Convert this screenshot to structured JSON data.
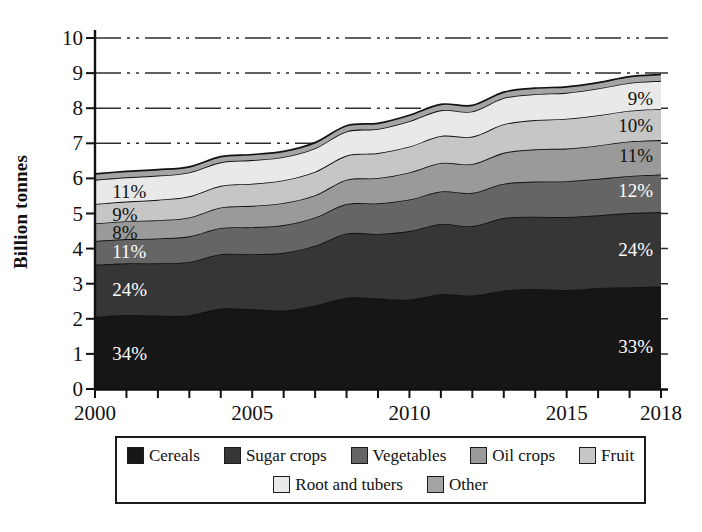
{
  "chart_data": {
    "type": "area",
    "stacked": true,
    "ylabel": "Billion tonnes",
    "ylim": [
      0,
      10
    ],
    "yticks": [
      0,
      1,
      2,
      3,
      4,
      5,
      6,
      7,
      8,
      9,
      10
    ],
    "x": [
      2000,
      2001,
      2002,
      2003,
      2004,
      2005,
      2006,
      2007,
      2008,
      2009,
      2010,
      2011,
      2012,
      2013,
      2014,
      2015,
      2016,
      2017,
      2018
    ],
    "xtick_labeled_years": [
      2000,
      2005,
      2010,
      2015,
      2018
    ],
    "grid": {
      "visible": true,
      "style": "dash-dot",
      "color": "#2e2e2e"
    },
    "legend_position": "bottom",
    "series": [
      {
        "name": "Cereals",
        "color": "#161616",
        "values": [
          2.06,
          2.11,
          2.09,
          2.1,
          2.29,
          2.27,
          2.24,
          2.38,
          2.6,
          2.58,
          2.55,
          2.7,
          2.66,
          2.81,
          2.85,
          2.82,
          2.88,
          2.9,
          2.92
        ]
      },
      {
        "name": "Sugar crops",
        "color": "#363636",
        "values": [
          1.48,
          1.47,
          1.49,
          1.52,
          1.55,
          1.57,
          1.64,
          1.7,
          1.83,
          1.84,
          1.95,
          2.0,
          1.98,
          2.06,
          2.06,
          2.08,
          2.07,
          2.11,
          2.12
        ]
      },
      {
        "name": "Vegetables",
        "color": "#656565",
        "values": [
          0.68,
          0.69,
          0.71,
          0.73,
          0.75,
          0.77,
          0.79,
          0.81,
          0.84,
          0.87,
          0.9,
          0.93,
          0.95,
          0.98,
          1.0,
          1.02,
          1.04,
          1.06,
          1.07
        ]
      },
      {
        "name": "Oil crops",
        "color": "#9a9a9a",
        "values": [
          0.5,
          0.51,
          0.52,
          0.54,
          0.58,
          0.61,
          0.63,
          0.63,
          0.69,
          0.72,
          0.77,
          0.81,
          0.82,
          0.88,
          0.92,
          0.93,
          0.95,
          0.98,
          0.98
        ]
      },
      {
        "name": "Fruit",
        "color": "#c6c6c6",
        "values": [
          0.55,
          0.56,
          0.58,
          0.6,
          0.62,
          0.63,
          0.65,
          0.67,
          0.69,
          0.71,
          0.74,
          0.77,
          0.78,
          0.81,
          0.83,
          0.85,
          0.86,
          0.88,
          0.89
        ]
      },
      {
        "name": "Root and tubers",
        "color": "#e9e9e9",
        "values": [
          0.69,
          0.69,
          0.69,
          0.68,
          0.67,
          0.67,
          0.66,
          0.67,
          0.69,
          0.69,
          0.72,
          0.73,
          0.72,
          0.75,
          0.74,
          0.74,
          0.76,
          0.79,
          0.8
        ]
      },
      {
        "name": "Other",
        "color": "#a4a4a4",
        "values": [
          0.17,
          0.17,
          0.17,
          0.16,
          0.16,
          0.16,
          0.16,
          0.16,
          0.16,
          0.16,
          0.17,
          0.17,
          0.17,
          0.17,
          0.17,
          0.17,
          0.17,
          0.18,
          0.18
        ]
      }
    ],
    "annotations": [
      {
        "text": "11%",
        "x": 2000.55,
        "y": 5.63,
        "align": "start",
        "color": "#111111",
        "series": "Root and tubers"
      },
      {
        "text": "9%",
        "x": 2000.55,
        "y": 5.0,
        "align": "start",
        "color": "#111111",
        "series": "Fruit"
      },
      {
        "text": "8%",
        "x": 2000.55,
        "y": 4.47,
        "align": "start",
        "color": "#111111",
        "series": "Oil crops"
      },
      {
        "text": "11%",
        "x": 2000.55,
        "y": 3.93,
        "align": "start",
        "color": "#ffffff",
        "series": "Vegetables"
      },
      {
        "text": "24%",
        "x": 2000.55,
        "y": 2.84,
        "align": "start",
        "color": "#ffffff",
        "series": "Sugar crops"
      },
      {
        "text": "34%",
        "x": 2000.55,
        "y": 1.02,
        "align": "start",
        "color": "#ffffff",
        "series": "Cereals"
      },
      {
        "text": "9%",
        "x": 2017.75,
        "y": 8.28,
        "align": "end",
        "color": "#111111",
        "series": "Root and tubers"
      },
      {
        "text": "10%",
        "x": 2017.75,
        "y": 7.53,
        "align": "end",
        "color": "#111111",
        "series": "Fruit"
      },
      {
        "text": "11%",
        "x": 2017.75,
        "y": 6.66,
        "align": "end",
        "color": "#111111",
        "series": "Oil crops"
      },
      {
        "text": "12%",
        "x": 2017.75,
        "y": 5.68,
        "align": "end",
        "color": "#ffffff",
        "series": "Vegetables"
      },
      {
        "text": "24%",
        "x": 2017.75,
        "y": 4.0,
        "align": "end",
        "color": "#ffffff",
        "series": "Sugar crops"
      },
      {
        "text": "33%",
        "x": 2017.75,
        "y": 1.22,
        "align": "end",
        "color": "#ffffff",
        "series": "Cereals"
      }
    ]
  },
  "legend": {
    "rows": [
      [
        "Cereals",
        "Sugar crops",
        "Vegetables",
        "Oil crops",
        "Fruit"
      ],
      [
        "Root and tubers",
        "Other"
      ]
    ]
  }
}
